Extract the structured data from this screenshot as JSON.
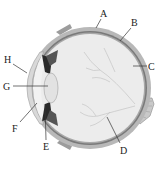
{
  "diagram": {
    "labels": [
      {
        "id": "A",
        "text": "A",
        "x": 103,
        "y": 17,
        "line": [
          101,
          19,
          96,
          28
        ]
      },
      {
        "id": "B",
        "text": "B",
        "x": 134,
        "y": 26,
        "line": [
          131,
          28,
          120,
          41
        ]
      },
      {
        "id": "C",
        "text": "C",
        "x": 150,
        "y": 70,
        "line": [
          133,
          66,
          147,
          66
        ]
      },
      {
        "id": "D",
        "text": "D",
        "x": 124,
        "y": 154,
        "line": [
          107,
          117,
          120,
          143
        ]
      },
      {
        "id": "E",
        "text": "E",
        "x": 46,
        "y": 150,
        "line": [
          45,
          104,
          46,
          140
        ]
      },
      {
        "id": "F",
        "text": "F",
        "x": 15,
        "y": 132,
        "line": [
          37,
          103,
          20,
          122
        ]
      },
      {
        "id": "G",
        "text": "G",
        "x": 7,
        "y": 90,
        "line": [
          13,
          86,
          48,
          86
        ]
      },
      {
        "id": "H",
        "text": "H",
        "x": 8,
        "y": 63,
        "line": [
          13,
          64,
          27,
          73
        ]
      }
    ],
    "colors": {
      "sclera": "#b8b8b8",
      "choroid": "#7a7a7a",
      "retina": "#9a9a9a",
      "vitreous": "#ececec",
      "lens": "#e2e2e2",
      "iris": "#2a2a2a",
      "vessels": "#c8c8c8"
    }
  }
}
